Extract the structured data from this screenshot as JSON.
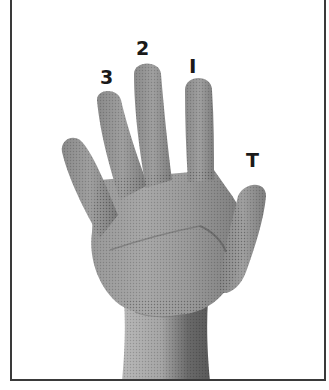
{
  "figure": {
    "labels": {
      "ring_finger": "3",
      "middle_finger": "2",
      "index_finger": "I",
      "thumb": "T"
    },
    "colors": {
      "border": "#3a3a3a",
      "label": "#1a1a1a",
      "background": "#ffffff",
      "skin_light": "#bdbdbd",
      "skin_mid": "#8f8f8f",
      "skin_dark": "#5e5e5e"
    }
  }
}
